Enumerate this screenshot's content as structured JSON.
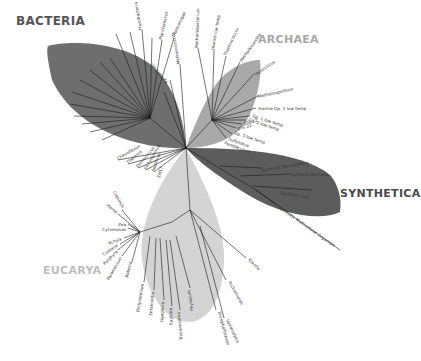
{
  "diagram": {
    "type": "unrooted phylogenetic tree of life",
    "domains": [
      {
        "id": "bacteria",
        "label": "BACTERIA",
        "color": "#6e6e6e",
        "label_color": "#555555"
      },
      {
        "id": "archaea",
        "label": "ARCHAEA",
        "color": "#a9a9a9",
        "label_color": "#a8a8a8"
      },
      {
        "id": "synthetica",
        "label": "SYNTHETICA",
        "color": "#5c5c5c",
        "label_color": "#4a4a4a"
      },
      {
        "id": "eucarya",
        "label": "EUCARYA",
        "color": "#d4d4d4",
        "label_color": "#bdbdbd"
      }
    ],
    "leaves": {
      "bacteria": [
        "Planctomyces",
        "Thermotogae",
        "Flavobacteria",
        "Cyanobacteria",
        "Chlamydiae",
        "Spirochetes",
        "Proteobacteria",
        "Chloroflexi",
        "Actinobacteria",
        "Firmicutes",
        "Chlorobi",
        "Thermus",
        "Deinococcus",
        "Aquifex",
        "OP11",
        "Marinimicrobia",
        "Chloroflexus",
        "Thermodesulfobacteria",
        "Dictyoglomus",
        "Aquificae",
        "EM17"
      ],
      "archaea": [
        "Thermoproteus",
        "Pyrodictium",
        "Methanococcus",
        "Methanobacterium",
        "Thermococcus",
        "Methanosarcina",
        "Halococcus",
        "marine low temp",
        "Methanospirillum",
        "marine Gp. 1 low temp",
        "Gp. 1 low temp",
        "Gp. 2 low temp",
        "pSL 12",
        "pSL 22",
        "Gp. 3 low temp",
        "Sulfolobus",
        "Pyrobaculum",
        "pJP 78"
      ],
      "synthetica": [
        "Synthetic Yeast",
        "Synthetic Mycoplasma",
        "Synthetic Bacteria",
        "Synthetic Cell",
        "Synthetic Multicellular Organism"
      ],
      "eucarya": [
        "Coprinus",
        "Homo",
        "Zea",
        "Cytomonas",
        "Achyla",
        "Costaria",
        "Porphyra",
        "Paramecium",
        "Babesia",
        "Dictyostelium",
        "Entamoeba",
        "Naegleria",
        "Euglena",
        "Trypanosoma",
        "Physarum",
        "Giardia",
        "Trichomonas",
        "Encephalitozoon",
        "Vairimorpha"
      ]
    }
  }
}
